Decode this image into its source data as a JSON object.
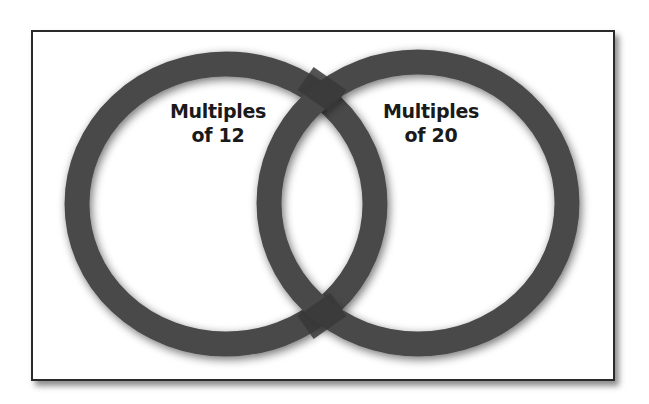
{
  "diagram": {
    "type": "venn",
    "sets": [
      {
        "id": "left",
        "label_line1": "Multiples",
        "label_line2": "of 12"
      },
      {
        "id": "right",
        "label_line1": "Multiples",
        "label_line2": "of 20"
      }
    ],
    "colors": {
      "ring": "#4a4a4a",
      "ring_overlap": "#333333",
      "frame_border": "#2a2a2a",
      "background": "#ffffff",
      "text": "#1a1a1a"
    }
  }
}
